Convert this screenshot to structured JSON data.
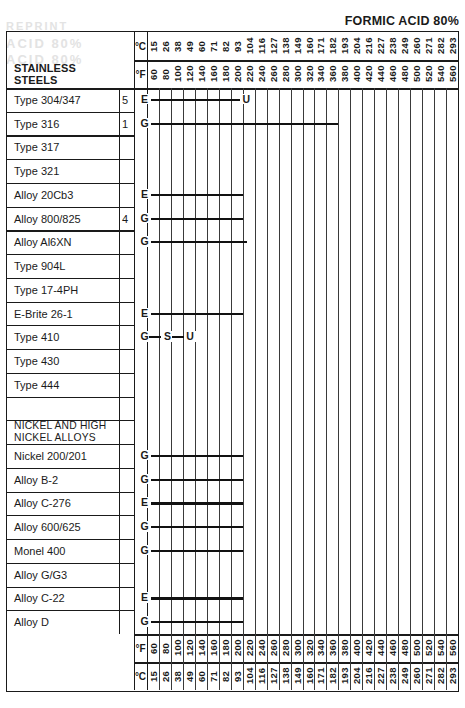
{
  "title": "FORMIC ACID 80%",
  "ghost_text": {
    "line1": "REPRINT",
    "line2": "ACID 80%",
    "line3": "ACID 80%"
  },
  "axis": {
    "celsius_unit": "°C",
    "fahrenheit_unit": "°F",
    "celsius": [
      15,
      26,
      38,
      49,
      60,
      71,
      82,
      93,
      104,
      116,
      127,
      138,
      149,
      160,
      171,
      182,
      193,
      204,
      216,
      227,
      238,
      249,
      260,
      271,
      282,
      293
    ],
    "fahrenheit": [
      60,
      80,
      100,
      120,
      140,
      160,
      180,
      200,
      220,
      240,
      260,
      280,
      300,
      320,
      340,
      360,
      380,
      400,
      420,
      440,
      460,
      480,
      500,
      520,
      540,
      560
    ]
  },
  "section_headers": {
    "stainless": "STAINLESS STEELS",
    "nickel": "NICKEL AND HIGH\nNICKEL ALLOYS"
  },
  "rows": [
    {
      "label": "Type 304/347",
      "note": "5",
      "start_marker": "E",
      "end_marker": "U",
      "bar_start_col": 0,
      "bar_end_col": 8
    },
    {
      "label": "Type 316",
      "note": "1",
      "start_marker": "G",
      "end_marker": "",
      "bar_start_col": 0,
      "bar_end_col": 16
    },
    {
      "label": "Type 317",
      "note": "",
      "start_marker": "",
      "end_marker": "",
      "bar_start_col": null,
      "bar_end_col": null
    },
    {
      "label": "Type 321",
      "note": "",
      "start_marker": "",
      "end_marker": "",
      "bar_start_col": null,
      "bar_end_col": null
    },
    {
      "label": "Alloy 20Cb3",
      "note": "",
      "start_marker": "E",
      "end_marker": "",
      "bar_start_col": 0,
      "bar_end_col": 8
    },
    {
      "label": "Alloy 800/825",
      "note": "4",
      "start_marker": "G",
      "end_marker": "",
      "bar_start_col": 0,
      "bar_end_col": 8
    },
    {
      "label": "Alloy Al6XN",
      "note": "",
      "start_marker": "G",
      "end_marker": "",
      "bar_start_col": 0,
      "bar_end_col": 8.4
    },
    {
      "label": "Type 904L",
      "note": "",
      "start_marker": "",
      "end_marker": "",
      "bar_start_col": null,
      "bar_end_col": null
    },
    {
      "label": "Type 17-4PH",
      "note": "",
      "start_marker": "",
      "end_marker": "",
      "bar_start_col": null,
      "bar_end_col": null
    },
    {
      "label": "E-Brite 26-1",
      "note": "",
      "start_marker": "E",
      "end_marker": "",
      "bar_start_col": 0,
      "bar_end_col": 8
    },
    {
      "label": "Type 410",
      "note": "",
      "start_marker": "G",
      "end_marker": "",
      "bar_start_col": null,
      "bar_end_col": null,
      "step_markers": [
        "G",
        "S",
        "U"
      ]
    },
    {
      "label": "Type 430",
      "note": "",
      "start_marker": "",
      "end_marker": "",
      "bar_start_col": null,
      "bar_end_col": null
    },
    {
      "label": "Type 444",
      "note": "",
      "start_marker": "",
      "end_marker": "",
      "bar_start_col": null,
      "bar_end_col": null
    },
    {
      "label": "",
      "note": "",
      "start_marker": "",
      "end_marker": "",
      "bar_start_col": null,
      "bar_end_col": null
    },
    {
      "label": "NICKEL AND HIGH\nNICKEL ALLOYS",
      "note": "",
      "start_marker": "",
      "end_marker": "",
      "bar_start_col": null,
      "bar_end_col": null,
      "is_group": true
    },
    {
      "label": "Nickel 200/201",
      "note": "",
      "start_marker": "G",
      "end_marker": "",
      "bar_start_col": 0,
      "bar_end_col": 8
    },
    {
      "label": "Alloy B-2",
      "note": "",
      "start_marker": "G",
      "end_marker": "",
      "bar_start_col": 0,
      "bar_end_col": 8
    },
    {
      "label": "Alloy C-276",
      "note": "",
      "start_marker": "E",
      "end_marker": "",
      "bar_start_col": 0,
      "bar_end_col": 8
    },
    {
      "label": "Alloy 600/625",
      "note": "",
      "start_marker": "G",
      "end_marker": "",
      "bar_start_col": 0,
      "bar_end_col": 8
    },
    {
      "label": "Monel 400",
      "note": "",
      "start_marker": "G",
      "end_marker": "",
      "bar_start_col": 0,
      "bar_end_col": 8
    },
    {
      "label": "Alloy G/G3",
      "note": "",
      "start_marker": "",
      "end_marker": "",
      "bar_start_col": null,
      "bar_end_col": null
    },
    {
      "label": "Alloy C-22",
      "note": "",
      "start_marker": "E",
      "end_marker": "",
      "bar_start_col": 0,
      "bar_end_col": 8
    },
    {
      "label": "Alloy D",
      "note": "",
      "start_marker": "G",
      "end_marker": "",
      "bar_start_col": 0,
      "bar_end_col": 8
    }
  ],
  "chart_data": {
    "type": "table",
    "title": "FORMIC ACID 80%",
    "xlabel": "Temperature",
    "ylabel": "Alloy",
    "x_units": [
      "°C",
      "°F"
    ],
    "x_celsius": [
      15,
      26,
      38,
      49,
      60,
      71,
      82,
      93,
      104,
      116,
      127,
      138,
      149,
      160,
      171,
      182,
      193,
      204,
      216,
      227,
      238,
      249,
      260,
      271,
      282,
      293
    ],
    "x_fahrenheit": [
      60,
      80,
      100,
      120,
      140,
      160,
      180,
      200,
      220,
      240,
      260,
      280,
      300,
      320,
      340,
      360,
      380,
      400,
      420,
      440,
      460,
      480,
      500,
      520,
      540,
      560
    ],
    "grid": true,
    "legend": "none",
    "series": [
      {
        "name": "Type 304/347",
        "group": "STAINLESS STEELS",
        "note": "5",
        "rating_start": "E",
        "rating_end": "U",
        "temp_range_f": [
          60,
          220
        ],
        "temp_range_c": [
          15,
          93
        ]
      },
      {
        "name": "Type 316",
        "group": "STAINLESS STEELS",
        "note": "1",
        "rating_start": "G",
        "rating_end": "",
        "temp_range_f": [
          60,
          380
        ],
        "temp_range_c": [
          15,
          193
        ]
      },
      {
        "name": "Type 317",
        "group": "STAINLESS STEELS",
        "note": "",
        "rating_start": "",
        "rating_end": "",
        "temp_range_f": null,
        "temp_range_c": null
      },
      {
        "name": "Type 321",
        "group": "STAINLESS STEELS",
        "note": "",
        "rating_start": "",
        "rating_end": "",
        "temp_range_f": null,
        "temp_range_c": null
      },
      {
        "name": "Alloy 20Cb3",
        "group": "STAINLESS STEELS",
        "note": "",
        "rating_start": "E",
        "rating_end": "",
        "temp_range_f": [
          60,
          220
        ],
        "temp_range_c": [
          15,
          93
        ]
      },
      {
        "name": "Alloy 800/825",
        "group": "STAINLESS STEELS",
        "note": "4",
        "rating_start": "G",
        "rating_end": "",
        "temp_range_f": [
          60,
          220
        ],
        "temp_range_c": [
          15,
          93
        ]
      },
      {
        "name": "Alloy Al6XN",
        "group": "STAINLESS STEELS",
        "note": "",
        "rating_start": "G",
        "rating_end": "",
        "temp_range_f": [
          60,
          230
        ],
        "temp_range_c": [
          15,
          99
        ]
      },
      {
        "name": "Type 904L",
        "group": "STAINLESS STEELS",
        "note": "",
        "rating_start": "",
        "rating_end": "",
        "temp_range_f": null,
        "temp_range_c": null
      },
      {
        "name": "Type 17-4PH",
        "group": "STAINLESS STEELS",
        "note": "",
        "rating_start": "",
        "rating_end": "",
        "temp_range_f": null,
        "temp_range_c": null
      },
      {
        "name": "E-Brite 26-1",
        "group": "STAINLESS STEELS",
        "note": "",
        "rating_start": "E",
        "rating_end": "",
        "temp_range_f": [
          60,
          220
        ],
        "temp_range_c": [
          15,
          93
        ]
      },
      {
        "name": "Type 410",
        "group": "STAINLESS STEELS",
        "note": "",
        "rating_start": "G",
        "rating_end": "U",
        "ratings_sequence": [
          "G",
          "S",
          "U"
        ],
        "temp_range_f": [
          60,
          100
        ],
        "temp_range_c": [
          15,
          38
        ]
      },
      {
        "name": "Type 430",
        "group": "STAINLESS STEELS",
        "note": "",
        "rating_start": "",
        "rating_end": "",
        "temp_range_f": null,
        "temp_range_c": null
      },
      {
        "name": "Type 444",
        "group": "STAINLESS STEELS",
        "note": "",
        "rating_start": "",
        "rating_end": "",
        "temp_range_f": null,
        "temp_range_c": null
      },
      {
        "name": "Nickel 200/201",
        "group": "NICKEL AND HIGH NICKEL ALLOYS",
        "note": "",
        "rating_start": "G",
        "rating_end": "",
        "temp_range_f": [
          60,
          220
        ],
        "temp_range_c": [
          15,
          93
        ]
      },
      {
        "name": "Alloy B-2",
        "group": "NICKEL AND HIGH NICKEL ALLOYS",
        "note": "",
        "rating_start": "G",
        "rating_end": "",
        "temp_range_f": [
          60,
          220
        ],
        "temp_range_c": [
          15,
          93
        ]
      },
      {
        "name": "Alloy C-276",
        "group": "NICKEL AND HIGH NICKEL ALLOYS",
        "note": "",
        "rating_start": "E",
        "rating_end": "",
        "temp_range_f": [
          60,
          220
        ],
        "temp_range_c": [
          15,
          93
        ]
      },
      {
        "name": "Alloy 600/625",
        "group": "NICKEL AND HIGH NICKEL ALLOYS",
        "note": "",
        "rating_start": "G",
        "rating_end": "",
        "temp_range_f": [
          60,
          220
        ],
        "temp_range_c": [
          15,
          93
        ]
      },
      {
        "name": "Monel 400",
        "group": "NICKEL AND HIGH NICKEL ALLOYS",
        "note": "",
        "rating_start": "G",
        "rating_end": "",
        "temp_range_f": [
          60,
          220
        ],
        "temp_range_c": [
          15,
          93
        ]
      },
      {
        "name": "Alloy G/G3",
        "group": "NICKEL AND HIGH NICKEL ALLOYS",
        "note": "",
        "rating_start": "",
        "rating_end": "",
        "temp_range_f": null,
        "temp_range_c": null
      },
      {
        "name": "Alloy C-22",
        "group": "NICKEL AND HIGH NICKEL ALLOYS",
        "note": "",
        "rating_start": "E",
        "rating_end": "",
        "temp_range_f": [
          60,
          220
        ],
        "temp_range_c": [
          15,
          93
        ]
      },
      {
        "name": "Alloy D",
        "group": "NICKEL AND HIGH NICKEL ALLOYS",
        "note": "",
        "rating_start": "G",
        "rating_end": "",
        "temp_range_f": [
          60,
          220
        ],
        "temp_range_c": [
          15,
          93
        ]
      }
    ]
  }
}
